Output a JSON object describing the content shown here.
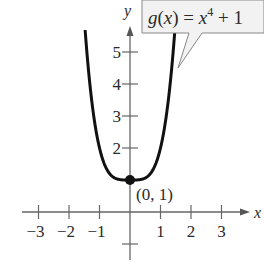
{
  "chart_data": {
    "type": "line",
    "title": "",
    "function_label": "g(x) = x^4 + 1",
    "function_parts": {
      "name": "g(x) = x",
      "exponent": "4",
      "tail": " + 1"
    },
    "xlabel": "x",
    "ylabel": "y",
    "xlim": [
      -3.3,
      3.8
    ],
    "ylim": [
      -1.3,
      5.8
    ],
    "x_ticks": [
      -3,
      -2,
      -1,
      1,
      2,
      3
    ],
    "x_tick_labels": [
      "−3",
      "−2",
      "−1",
      "1",
      "2",
      "3"
    ],
    "y_ticks": [
      -1,
      1,
      2,
      3,
      4,
      5
    ],
    "y_tick_labels": [
      "2",
      "3",
      "4",
      "5"
    ],
    "series": [
      {
        "name": "g(x) = x^4 + 1",
        "x": [
          -1.5,
          -1.4,
          -1.3,
          -1.2,
          -1.1,
          -1.0,
          -0.8,
          -0.6,
          -0.4,
          -0.2,
          0,
          0.2,
          0.4,
          0.6,
          0.8,
          1.0,
          1.1,
          1.2,
          1.3,
          1.4,
          1.5
        ],
        "values": [
          6.06,
          4.84,
          3.86,
          3.07,
          2.46,
          2.0,
          1.41,
          1.13,
          1.03,
          1.0,
          1.0,
          1.0,
          1.03,
          1.13,
          1.41,
          2.0,
          2.46,
          3.07,
          3.86,
          4.84,
          6.06
        ]
      }
    ],
    "points": [
      {
        "x": 0,
        "y": 1,
        "label": "(0, 1)"
      }
    ],
    "grid": false,
    "legend": "callout box, top-right"
  },
  "colors": {
    "curve": "#111111",
    "axis": "#555555",
    "callout_fill": "#f2f2f2",
    "callout_border": "#888888",
    "text": "#2a2a2a"
  }
}
